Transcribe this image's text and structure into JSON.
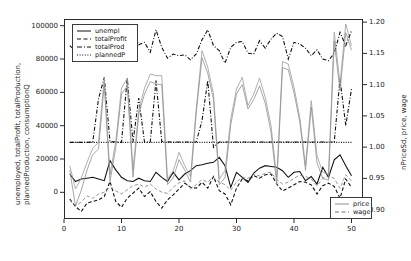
{
  "chart_data": {
    "type": "line",
    "title": "",
    "xlabel": "",
    "ylabel": "unemployed, totalProfit, totalProduction, plannedProduction, consumptionQ",
    "ylabel_line1": "unemployed, totalProfit, totalProduction,",
    "ylabel_line2": "plannedProduction, consumptionQ",
    "y2label": "nPriceSd, price, wage",
    "grid": false,
    "xlim": [
      0,
      52
    ],
    "ylim": [
      -16000,
      104000
    ],
    "y2lim": [
      0.885,
      1.205
    ],
    "xticks": [
      "0",
      "10",
      "20",
      "30",
      "40",
      "50"
    ],
    "xtick_values": [
      0,
      10,
      20,
      30,
      40,
      50
    ],
    "yticks": [
      "0",
      "20000",
      "40000",
      "60000",
      "80000",
      "100000"
    ],
    "ytick_values": [
      0,
      20000,
      40000,
      60000,
      80000,
      100000
    ],
    "y2ticks": [
      "0.90",
      "0.95",
      "1.00",
      "1.05",
      "1.10",
      "1.15",
      "1.20"
    ],
    "y2tick_values": [
      0.9,
      0.95,
      1.0,
      1.05,
      1.1,
      1.15,
      1.2
    ],
    "legend_primary_position": "top-left",
    "legend_secondary_position": "bottom-right",
    "x": [
      1,
      2,
      3,
      4,
      5,
      6,
      7,
      8,
      9,
      10,
      11,
      12,
      13,
      14,
      15,
      16,
      17,
      18,
      19,
      20,
      21,
      22,
      23,
      24,
      25,
      26,
      27,
      28,
      29,
      30,
      31,
      32,
      33,
      34,
      35,
      36,
      37,
      38,
      39,
      40,
      41,
      42,
      43,
      44,
      45,
      46,
      47,
      48,
      49,
      50
    ],
    "series": [
      {
        "name": "unempl",
        "axis": "left",
        "style": "solid",
        "color": "#111111",
        "values": [
          11000,
          6500,
          8000,
          8500,
          9000,
          8000,
          7000,
          19000,
          13500,
          9000,
          7000,
          6500,
          8500,
          7000,
          6500,
          12000,
          9000,
          6500,
          12000,
          7500,
          11000,
          13000,
          16000,
          16500,
          17500,
          18000,
          21000,
          16000,
          3000,
          12000,
          9000,
          6000,
          11500,
          14500,
          16000,
          15500,
          15000,
          13000,
          9000,
          12000,
          12500,
          7000,
          9500,
          5000,
          15000,
          9000,
          19500,
          22500,
          16000,
          10000
        ]
      },
      {
        "name": "totalProfit",
        "axis": "left",
        "style": "dashed",
        "color": "#111111",
        "values": [
          -4000,
          -8500,
          -11500,
          -6500,
          -5500,
          -4500,
          -2500,
          6500,
          -5500,
          -9000,
          -3500,
          -500,
          2500,
          -2500,
          400,
          -5500,
          -9500,
          -4500,
          -1500,
          2000,
          5500,
          3000,
          2500,
          6000,
          2500,
          9500,
          1000,
          -1000,
          -7500,
          2500,
          8000,
          7000,
          10000,
          8500,
          10500,
          11000,
          5000,
          800,
          2500,
          4500,
          6500,
          6000,
          4500,
          -1000,
          4000,
          5500,
          3500,
          -3500,
          8000,
          3000
        ]
      },
      {
        "name": "totalProd",
        "axis": "left",
        "style": "dashdot",
        "color": "#111111",
        "values": [
          30000,
          30000,
          30000,
          30000,
          30200,
          56000,
          69000,
          30500,
          30200,
          30000,
          68500,
          30200,
          56500,
          30200,
          30200,
          67000,
          30500,
          30300,
          30200,
          30200,
          30200,
          30200,
          30200,
          43000,
          67000,
          27000,
          30200,
          30200,
          30200,
          30200,
          30200,
          30200,
          30200,
          30200,
          30200,
          30200,
          30200,
          30200,
          30200,
          30200,
          30200,
          30200,
          30200,
          30200,
          30200,
          30200,
          30200,
          68000,
          40000,
          62000
        ]
      },
      {
        "name": "plannedP",
        "axis": "left",
        "style": "dotted",
        "color": "#111111",
        "values": [
          30000,
          30000,
          30000,
          30000,
          30000,
          30000,
          30000,
          30000,
          30000,
          30000,
          30000,
          30000,
          30000,
          30000,
          30000,
          30000,
          30000,
          30000,
          30000,
          30000,
          30000,
          30000,
          30000,
          30000,
          30000,
          30000,
          30000,
          30000,
          30000,
          30000,
          30000,
          30000,
          30000,
          30000,
          30000,
          30000,
          30000,
          30000,
          30000,
          30000,
          30000,
          30000,
          30000,
          30000,
          30000,
          30000,
          30000,
          30000,
          30000,
          30000
        ]
      },
      {
        "name": "nPriceSd",
        "axis": "left",
        "style": "solid-grey",
        "color": "#9a9a9a",
        "values": [
          16000,
          2000,
          8500,
          18000,
          26500,
          30000,
          69000,
          10500,
          30500,
          62500,
          68500,
          13500,
          49500,
          62500,
          71000,
          70000,
          70000,
          8000,
          13000,
          24000,
          16000,
          9500,
          50000,
          85000,
          75000,
          59000,
          8000,
          13000,
          44000,
          62000,
          69000,
          52000,
          59000,
          68500,
          57000,
          40000,
          9000,
          78500,
          77000,
          63000,
          45000,
          16000,
          55000,
          22000,
          12000,
          11000,
          96000,
          65000,
          101000,
          88000
        ]
      },
      {
        "name": "totalProdUpper",
        "axis": "left",
        "style": "dashdot-upper",
        "color": "#111111",
        "values": [
          88000,
          85000,
          88500,
          80500,
          90000,
          87000,
          88500,
          80500,
          86500,
          81500,
          88000,
          96000,
          88500,
          90000,
          84000,
          97500,
          87000,
          80500,
          83000,
          82000,
          82500,
          79500,
          83000,
          91500,
          97500,
          88000,
          85000,
          77500,
          87000,
          90000,
          90500,
          83500,
          83000,
          91000,
          86500,
          92000,
          95500,
          93500,
          80000,
          90000,
          89000,
          86500,
          82000,
          85500,
          80000,
          79000,
          83500,
          96000,
          88000,
          97000
        ]
      },
      {
        "name": "price",
        "axis": "right",
        "style": "solid-grey",
        "color": "#8f8f8f",
        "values": [
          0.963,
          0.906,
          0.931,
          0.963,
          0.988,
          0.997,
          1.1,
          0.945,
          0.999,
          1.085,
          1.098,
          0.952,
          1.053,
          1.085,
          1.105,
          1.101,
          1.1,
          0.94,
          0.951,
          0.98,
          0.963,
          0.944,
          1.055,
          1.143,
          1.118,
          1.076,
          0.94,
          0.951,
          1.036,
          1.085,
          1.1,
          1.061,
          1.076,
          1.098,
          1.07,
          1.024,
          0.941,
          1.127,
          1.124,
          1.087,
          1.041,
          0.963,
          1.064,
          0.975,
          0.95,
          0.947,
          1.17,
          1.09,
          1.183,
          1.155
        ]
      },
      {
        "name": "wage",
        "axis": "right",
        "style": "dashed-grey",
        "color": "#7d7d7d",
        "values": [
          0.915,
          0.906,
          0.912,
          0.922,
          0.918,
          0.925,
          0.928,
          0.936,
          0.93,
          0.925,
          0.932,
          0.938,
          0.941,
          0.936,
          0.941,
          0.933,
          0.928,
          0.926,
          0.936,
          0.943,
          0.946,
          0.933,
          0.94,
          0.948,
          0.944,
          0.952,
          0.944,
          0.94,
          0.931,
          0.944,
          0.952,
          0.95,
          0.957,
          0.954,
          0.958,
          0.96,
          0.948,
          0.941,
          0.944,
          0.95,
          0.955,
          0.953,
          0.949,
          0.938,
          0.95,
          0.954,
          0.95,
          0.934,
          0.956,
          0.946
        ]
      }
    ]
  },
  "legend_primary": {
    "items": [
      {
        "label": "unempl",
        "style": "solid"
      },
      {
        "label": "totalProfit",
        "style": "dashed"
      },
      {
        "label": "totalProd",
        "style": "dashdot"
      },
      {
        "label": "plannedP",
        "style": "dotted"
      }
    ]
  },
  "legend_secondary": {
    "items": [
      {
        "label": "price",
        "style": "solid"
      },
      {
        "label": "wage",
        "style": "dashed"
      }
    ]
  },
  "colors": {
    "axis": "#2b2b2b",
    "primary_line": "#111111",
    "secondary_line": "#9a9a9a",
    "background": "#ffffff"
  }
}
